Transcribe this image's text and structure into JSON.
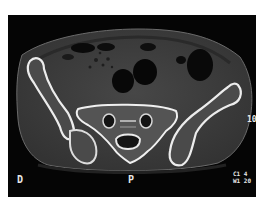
{
  "image": {
    "type": "axial-ct-scan",
    "subject": "pelvis at sacroiliac level",
    "background_color": "#050505",
    "bone_color": "#e6e6e6",
    "soft_tissue_color": "#3c3c3c"
  },
  "overlay": {
    "orientation_left": "D",
    "orientation_bottom": "P",
    "scale_marker": "10",
    "window_center_label": "C1",
    "window_center_value": "4",
    "window_width_label": "W1",
    "window_width_value": "20"
  }
}
